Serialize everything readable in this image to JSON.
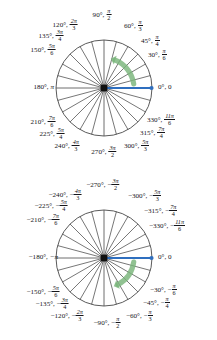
{
  "figure": {
    "colors": {
      "circle_stroke": "#3c3c3c",
      "spoke_stroke": "#4a4a4a",
      "axis_stroke": "#4a4a4a",
      "terminal_ray": "#2f6fbf",
      "center_dot": "#111111",
      "rotation_arrow": "#79b47a",
      "label_text": "#16161a",
      "background": "#ffffff"
    },
    "geometry": {
      "radius": 48,
      "spoke_step_degrees": 15,
      "positive_center": {
        "x": 104,
        "y": 88
      },
      "negative_center": {
        "x": 104,
        "y": 258
      }
    }
  },
  "positive_circle": {
    "name": "counterclockwise-positive-angles",
    "rotation_direction": "counterclockwise",
    "terminal_side_angle_deg": 0,
    "arrow_sweep_deg": [
      8,
      68
    ],
    "labels": [
      {
        "deg": "90°,",
        "num": "π",
        "den": "2",
        "angle": 90,
        "anchor": "center",
        "x": 102,
        "y": 15
      },
      {
        "deg": "120°,",
        "num": "2π",
        "den": "3",
        "angle": 120,
        "anchor": "right",
        "x": 78,
        "y": 25
      },
      {
        "deg": "135°,",
        "num": "3π",
        "den": "4",
        "angle": 135,
        "anchor": "right",
        "x": 64,
        "y": 36
      },
      {
        "deg": "150°,",
        "num": "5π",
        "den": "6",
        "angle": 150,
        "anchor": "right",
        "x": 56,
        "y": 50
      },
      {
        "deg": "180°,",
        "num": "",
        "den": "",
        "pi": "π",
        "angle": 180,
        "anchor": "right",
        "x": 54,
        "y": 88
      },
      {
        "deg": "210°,",
        "num": "7π",
        "den": "6",
        "angle": 210,
        "anchor": "right",
        "x": 56,
        "y": 122
      },
      {
        "deg": "225°,",
        "num": "5π",
        "den": "4",
        "angle": 225,
        "anchor": "right",
        "x": 65,
        "y": 134
      },
      {
        "deg": "240°,",
        "num": "4π",
        "den": "3",
        "angle": 240,
        "anchor": "right",
        "x": 80,
        "y": 146
      },
      {
        "deg": "270°,",
        "num": "3π",
        "den": "2",
        "angle": 270,
        "anchor": "center",
        "x": 104,
        "y": 152
      },
      {
        "deg": "300°,",
        "num": "5π",
        "den": "3",
        "angle": 300,
        "anchor": "left",
        "x": 124,
        "y": 146
      },
      {
        "deg": "315°,",
        "num": "7π",
        "den": "4",
        "angle": 315,
        "anchor": "left",
        "x": 140,
        "y": 133
      },
      {
        "deg": "330°,",
        "num": "11π",
        "den": "6",
        "angle": 330,
        "anchor": "left",
        "x": 147,
        "y": 120
      },
      {
        "deg": "0°, 0",
        "num": "",
        "den": "",
        "angle": 0,
        "anchor": "left",
        "x": 158,
        "y": 88
      },
      {
        "deg": "30°,",
        "num": "π",
        "den": "6",
        "angle": 30,
        "anchor": "left",
        "x": 148,
        "y": 55
      },
      {
        "deg": "45°,",
        "num": "π",
        "den": "4",
        "angle": 45,
        "anchor": "left",
        "x": 141,
        "y": 41
      },
      {
        "deg": "60°,",
        "num": "π",
        "den": "3",
        "angle": 60,
        "anchor": "left",
        "x": 124,
        "y": 26
      }
    ]
  },
  "negative_circle": {
    "name": "clockwise-negative-angles",
    "rotation_direction": "clockwise",
    "terminal_side_angle_deg": 0,
    "arrow_sweep_deg": [
      -8,
      -62
    ],
    "labels": [
      {
        "deg": "−270°,",
        "num": "3π",
        "den": "2",
        "minus": true,
        "angle": 90,
        "anchor": "center",
        "x": 103,
        "y": 185
      },
      {
        "deg": "−240°,",
        "num": "4π",
        "den": "3",
        "minus": true,
        "angle": 120,
        "anchor": "right",
        "x": 82,
        "y": 195
      },
      {
        "deg": "−225°,",
        "num": "5π",
        "den": "4",
        "minus": true,
        "angle": 135,
        "anchor": "right",
        "x": 68,
        "y": 206
      },
      {
        "deg": "−210°,",
        "num": "7π",
        "den": "6",
        "minus": true,
        "angle": 150,
        "anchor": "right",
        "x": 60,
        "y": 220
      },
      {
        "deg": "−180°,",
        "num": "",
        "den": "",
        "pi": "−π",
        "angle": 180,
        "anchor": "right",
        "x": 58,
        "y": 258
      },
      {
        "deg": "−150°,",
        "num": "5π",
        "den": "6",
        "minus": true,
        "angle": 210,
        "anchor": "right",
        "x": 60,
        "y": 292
      },
      {
        "deg": "−135°,",
        "num": "3π",
        "den": "4",
        "minus": true,
        "angle": 225,
        "anchor": "right",
        "x": 69,
        "y": 304
      },
      {
        "deg": "−120°,",
        "num": "2π",
        "den": "3",
        "minus": true,
        "angle": 240,
        "anchor": "right",
        "x": 84,
        "y": 316
      },
      {
        "deg": "−90°,",
        "num": "π",
        "den": "2",
        "minus": true,
        "angle": 270,
        "anchor": "center",
        "x": 107,
        "y": 323
      },
      {
        "deg": "−60°,",
        "num": "π",
        "den": "3",
        "minus": true,
        "angle": 300,
        "anchor": "left",
        "x": 126,
        "y": 316
      },
      {
        "deg": "−45°,",
        "num": "π",
        "den": "4",
        "minus": true,
        "angle": 315,
        "anchor": "left",
        "x": 143,
        "y": 303
      },
      {
        "deg": "−30°,",
        "num": "π",
        "den": "6",
        "minus": true,
        "angle": 330,
        "anchor": "left",
        "x": 150,
        "y": 290
      },
      {
        "deg": "0°, 0",
        "num": "",
        "den": "",
        "angle": 0,
        "anchor": "left",
        "x": 158,
        "y": 258
      },
      {
        "deg": "−330°,",
        "num": "11π",
        "den": "6",
        "minus": true,
        "angle": 30,
        "anchor": "left",
        "x": 149,
        "y": 226
      },
      {
        "deg": "−315°,",
        "num": "7π",
        "den": "4",
        "minus": true,
        "angle": 45,
        "anchor": "left",
        "x": 144,
        "y": 211
      },
      {
        "deg": "−300°,",
        "num": "5π",
        "den": "3",
        "minus": true,
        "angle": 60,
        "anchor": "left",
        "x": 128,
        "y": 196
      }
    ]
  }
}
